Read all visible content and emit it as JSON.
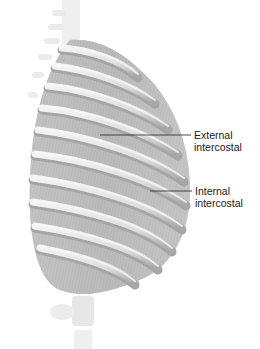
{
  "figure": {
    "colors": {
      "background": "#ffffff",
      "rib": "#e6e6e6",
      "rib_shadow": "#9a9a9a",
      "muscle": "#b9b9b9",
      "leader_line": "#222222",
      "text": "#1a1a1a"
    }
  },
  "labels": [
    {
      "id": "external",
      "line1": "External",
      "line2": "intercostal",
      "leader": {
        "x1": 100,
        "y1": 135,
        "x2": 191,
        "y2": 135
      }
    },
    {
      "id": "internal",
      "line1": "Internal",
      "line2": "intercostal",
      "leader": {
        "x1": 150,
        "y1": 191,
        "x2": 192,
        "y2": 191
      }
    }
  ]
}
